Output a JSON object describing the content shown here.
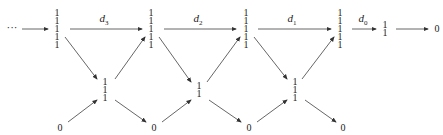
{
  "diagram": {
    "top_fragment": "1",
    "start": "···",
    "top_row": [
      {
        "id": "t0",
        "lines": [
          "1",
          "1",
          "1",
          "1",
          "1"
        ],
        "x": 57
      },
      {
        "id": "t1",
        "lines": [
          "1",
          "1",
          "1",
          "1",
          "1"
        ],
        "x": 151
      },
      {
        "id": "t2",
        "lines": [
          "1",
          "1",
          "1",
          "1",
          "1"
        ],
        "x": 246
      },
      {
        "id": "t3",
        "lines": [
          "1",
          "1",
          "1",
          "1",
          "1"
        ],
        "x": 340
      },
      {
        "id": "t4",
        "lines": [
          "1",
          "1"
        ],
        "x": 385
      },
      {
        "id": "t5",
        "lines": [
          "0"
        ],
        "x": 437
      }
    ],
    "maps": [
      {
        "label": "d",
        "sub": "3",
        "x": 104
      },
      {
        "label": "d",
        "sub": "2",
        "x": 198
      },
      {
        "label": "d",
        "sub": "1",
        "x": 292
      },
      {
        "label": "d",
        "sub": "0",
        "x": 363
      }
    ],
    "middle_row": [
      {
        "id": "m0",
        "lines": [
          "1",
          "1",
          "1"
        ],
        "x": 105
      },
      {
        "id": "m1",
        "lines": [
          "1",
          "1"
        ],
        "x": 199
      },
      {
        "id": "m2",
        "lines": [
          "1",
          "1",
          "1"
        ],
        "x": 295
      }
    ],
    "bottom_row": [
      {
        "id": "b0",
        "lines": [
          "0"
        ],
        "x": 60
      },
      {
        "id": "b1",
        "lines": [
          "0"
        ],
        "x": 154
      },
      {
        "id": "b2",
        "lines": [
          "0"
        ],
        "x": 249
      },
      {
        "id": "b3",
        "lines": [
          "0"
        ],
        "x": 343
      }
    ]
  }
}
